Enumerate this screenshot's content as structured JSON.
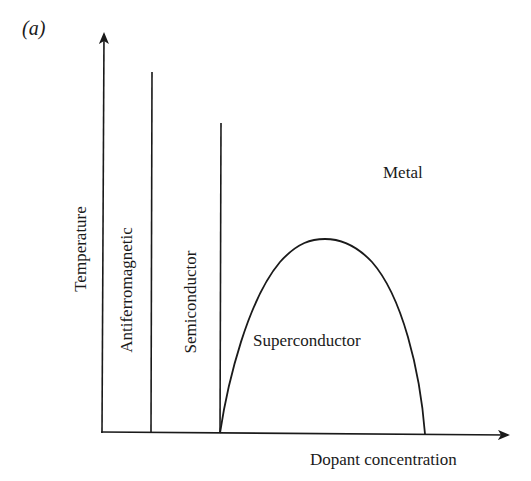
{
  "figure": {
    "panel_label": "(a)",
    "x_axis_label": "Dopant concentration",
    "y_axis_label": "Temperature",
    "regions": {
      "antiferromagnetic": "Antiferromagnetic",
      "semiconductor": "Semiconductor",
      "superconductor": "Superconductor",
      "metal": "Metal"
    },
    "line_color": "#1a1a1a"
  }
}
